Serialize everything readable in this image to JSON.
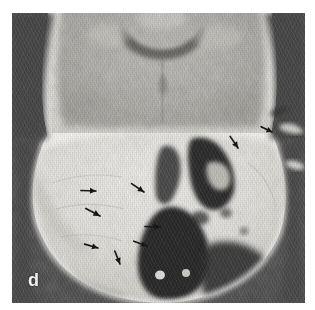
{
  "figure": {
    "panel_label": "d",
    "modality": "coronal CT",
    "canvas": {
      "width": 315,
      "height": 310,
      "background": "#ffffff"
    },
    "panel": {
      "x": 12,
      "y": 13,
      "width": 293,
      "height": 290
    }
  },
  "palette": {
    "page_background": "#ffffff",
    "air_background": "#4f4f4f",
    "air_dark": "#3a3a3a",
    "bone_bright": "#f4f2ee",
    "bone_mid": "#e2dfd9",
    "soft_tissue": "#c9c6c0",
    "brain_gray": "#b4b2ad",
    "brain_dark": "#9b9995",
    "ventricle": "#6f6d6a",
    "sinus_black": "#2e2e2e",
    "arrow_color": "#151515",
    "label_color": "#f2f2f2"
  },
  "annotations": {
    "arrow_count": 9,
    "arrows": [
      {
        "id": "arrow-1",
        "x": 96,
        "y": 191,
        "angle": 182,
        "length": 16,
        "note": "points left"
      },
      {
        "id": "arrow-2",
        "x": 100,
        "y": 216,
        "angle": 208,
        "length": 17,
        "note": "points down-left"
      },
      {
        "id": "arrow-3",
        "x": 98,
        "y": 248,
        "angle": 196,
        "length": 15,
        "note": "points left"
      },
      {
        "id": "arrow-4",
        "x": 120,
        "y": 264,
        "angle": 248,
        "length": 15,
        "note": "points down"
      },
      {
        "id": "arrow-5",
        "x": 144,
        "y": 192,
        "angle": 214,
        "length": 16,
        "note": "points down-left"
      },
      {
        "id": "arrow-6",
        "x": 147,
        "y": 246,
        "angle": 200,
        "length": 15,
        "note": "points left"
      },
      {
        "id": "arrow-7",
        "x": 160,
        "y": 227,
        "angle": 2,
        "length": 16,
        "note": "points right"
      },
      {
        "id": "arrow-8",
        "x": 238,
        "y": 148,
        "angle": 236,
        "length": 15,
        "note": "points down-left"
      },
      {
        "id": "arrow-9",
        "x": 272,
        "y": 132,
        "angle": 206,
        "length": 13,
        "note": "points down-left"
      }
    ]
  },
  "anatomy": {
    "regions": [
      {
        "name": "cranial-vault-brain",
        "description": "upper coronal brain parenchyma, mottled gray"
      },
      {
        "name": "lateral-ventricles",
        "description": "dark arched band at superior midline"
      },
      {
        "name": "skull-base-bone",
        "description": "bright dense petrous / skull base bone"
      },
      {
        "name": "mastoid-air-cells",
        "description": "irregular dark air spaces right of midline"
      },
      {
        "name": "nasopharyngeal-airway",
        "description": "large dark air space inferior midline"
      },
      {
        "name": "temporal-soft-tissue",
        "description": "soft tissue lateral to skull base"
      }
    ]
  }
}
